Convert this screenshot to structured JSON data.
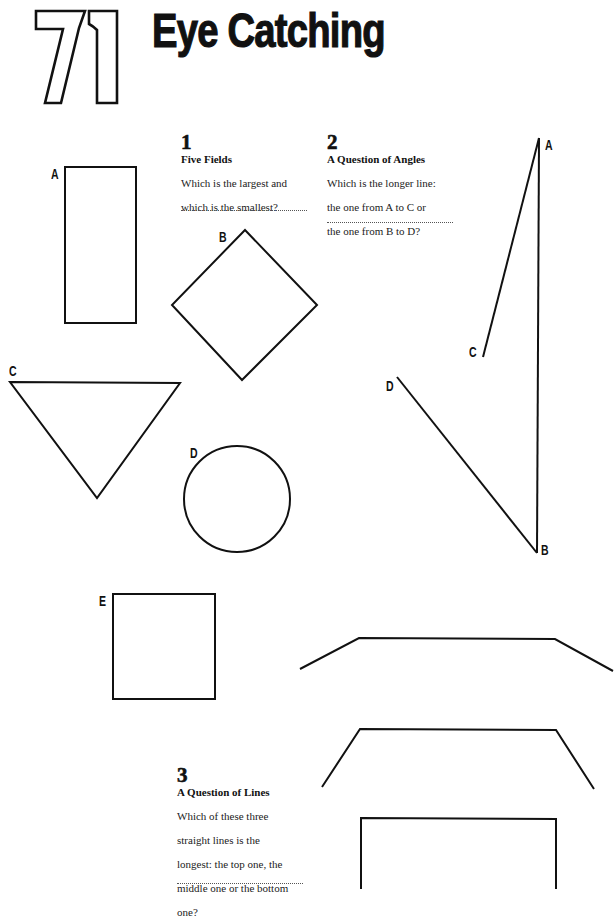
{
  "header": {
    "page_number": "71",
    "title": "Eye Catching"
  },
  "puzzles": [
    {
      "number": "1",
      "heading": "Five Fields",
      "question_lines": [
        "Which is the largest and",
        "which is the smallest?"
      ],
      "answer_placeholder": "............................"
    },
    {
      "number": "2",
      "heading": "A Question of Angles",
      "question_lines": [
        "Which is the longer line:",
        "the one from A to C or",
        "the one from B to D?"
      ],
      "answer_placeholder": "............................"
    },
    {
      "number": "3",
      "heading": "A Question of Lines",
      "question_lines": [
        "Which of these three",
        "straight lines is the",
        "longest: the top one, the",
        "middle one or the bottom",
        "one?"
      ],
      "answer_placeholder": "............................"
    }
  ],
  "five_fields": {
    "labels": {
      "a": "A",
      "b": "B",
      "c": "C",
      "d": "D",
      "e": "E"
    },
    "shapes": [
      {
        "label": "A",
        "type": "rectangle"
      },
      {
        "label": "B",
        "type": "diamond"
      },
      {
        "label": "C",
        "type": "triangle"
      },
      {
        "label": "D",
        "type": "circle"
      },
      {
        "label": "E",
        "type": "square"
      }
    ]
  },
  "angles_figure": {
    "labels": {
      "a": "A",
      "b": "B",
      "c": "C",
      "d": "D"
    }
  },
  "lines_figure": {
    "lines": [
      "top",
      "middle",
      "bottom"
    ]
  },
  "colors": {
    "ink": "#111111",
    "paper": "#ffffff"
  }
}
